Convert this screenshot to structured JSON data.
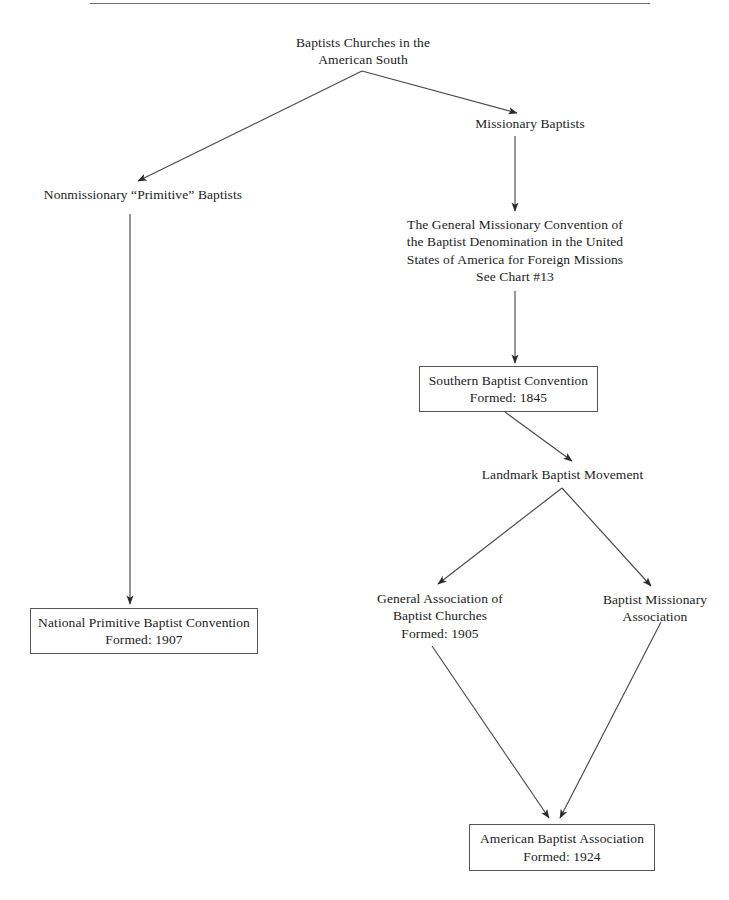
{
  "diagram": {
    "title_rule": true,
    "background_color": "#ffffff",
    "line_color": "#4a4a4a",
    "box_border_color": "#555555",
    "text_color": "#1c1c1c"
  },
  "nodes": [
    {
      "id": "baptist-churches-american-south",
      "lines": [
        "Baptists Churches in the",
        "American South"
      ],
      "boxed": false,
      "x": 268,
      "y": 34,
      "w": 190,
      "h": 34
    },
    {
      "id": "missionary-baptists",
      "lines": [
        "Missionary Baptists"
      ],
      "boxed": false,
      "x": 455,
      "y": 115,
      "w": 150,
      "h": 18
    },
    {
      "id": "nonmissionary-primitive-baptists",
      "lines": [
        "Nonmissionary “Primitive” Baptists"
      ],
      "boxed": false,
      "x": 28,
      "y": 186,
      "w": 230,
      "h": 18
    },
    {
      "id": "general-missionary-convention",
      "lines": [
        "The General Missionary Convention of",
        "the Baptist Denomination in the United",
        "States of America for Foreign Missions",
        "See Chart #13"
      ],
      "boxed": false,
      "x": 395,
      "y": 216,
      "w": 240,
      "h": 72
    },
    {
      "id": "southern-baptist-convention",
      "lines": [
        "Southern Baptist Convention",
        "Formed: 1845"
      ],
      "boxed": true,
      "x": 419,
      "y": 366,
      "w": 179,
      "h": 46
    },
    {
      "id": "landmark-baptist-movement",
      "lines": [
        "Landmark Baptist Movement"
      ],
      "boxed": false,
      "x": 470,
      "y": 466,
      "w": 185,
      "h": 18
    },
    {
      "id": "general-association-baptist-churches",
      "lines": [
        "General Association of",
        "Baptist Churches",
        "Formed: 1905"
      ],
      "boxed": false,
      "x": 370,
      "y": 590,
      "w": 140,
      "h": 54
    },
    {
      "id": "baptist-missionary-association",
      "lines": [
        "Baptist Missionary",
        "Association"
      ],
      "boxed": false,
      "x": 595,
      "y": 591,
      "w": 120,
      "h": 36
    },
    {
      "id": "national-primitive-baptist-convention",
      "lines": [
        "National Primitive Baptist Convention",
        "Formed: 1907"
      ],
      "boxed": true,
      "x": 30,
      "y": 608,
      "w": 228,
      "h": 46
    },
    {
      "id": "american-baptist-association",
      "lines": [
        "American Baptist Association",
        "Formed: 1924"
      ],
      "boxed": true,
      "x": 469,
      "y": 824,
      "w": 186,
      "h": 47
    }
  ],
  "edges": [
    {
      "id": "root-to-nonmissionary",
      "from": "baptist-churches-american-south",
      "to": "nonmissionary-primitive-baptists",
      "points": "362,71 138,181",
      "arrow": true
    },
    {
      "id": "root-to-missionary",
      "from": "baptist-churches-american-south",
      "to": "missionary-baptists",
      "points": "362,71 517,113",
      "arrow": true
    },
    {
      "id": "missionary-to-general-convention",
      "from": "missionary-baptists",
      "to": "general-missionary-convention",
      "points": "515,136 515,211",
      "arrow": true
    },
    {
      "id": "general-convention-to-sbc",
      "from": "general-missionary-convention",
      "to": "southern-baptist-convention",
      "points": "515,291 515,363",
      "arrow": true
    },
    {
      "id": "sbc-to-landmark",
      "from": "southern-baptist-convention",
      "to": "landmark-baptist-movement",
      "points": "505,412 572,461",
      "arrow": true
    },
    {
      "id": "landmark-to-general-association",
      "from": "landmark-baptist-movement",
      "to": "general-association-baptist-churches",
      "points": "562,488 438,584",
      "arrow": true
    },
    {
      "id": "landmark-to-baptist-missionary",
      "from": "landmark-baptist-movement",
      "to": "baptist-missionary-association",
      "points": "562,488 651,586",
      "arrow": true
    },
    {
      "id": "nonmissionary-to-national-primitive",
      "from": "nonmissionary-primitive-baptists",
      "to": "national-primitive-baptist-convention",
      "points": "130,214 130,604",
      "arrow": true
    },
    {
      "id": "general-association-to-american",
      "from": "general-association-baptist-churches",
      "to": "american-baptist-association",
      "points": "432,646 549,818",
      "arrow": true
    },
    {
      "id": "baptist-missionary-to-american",
      "from": "baptist-missionary-association",
      "to": "american-baptist-association",
      "points": "661,622 560,818",
      "arrow": true
    }
  ]
}
